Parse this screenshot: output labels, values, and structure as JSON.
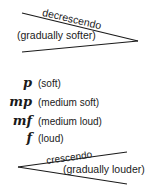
{
  "decrescendo": {
    "name": "decrescendo",
    "meaning": "(gradually softer)"
  },
  "dynamics": [
    {
      "symbol": "p",
      "meaning": "(soft)"
    },
    {
      "symbol": "mp",
      "meaning": "(medium soft)"
    },
    {
      "symbol": "mf",
      "meaning": "(medium loud)"
    },
    {
      "symbol": "f",
      "meaning": "(loud)"
    }
  ],
  "crescendo": {
    "name": "crescendo",
    "meaning": "(gradually louder)"
  }
}
